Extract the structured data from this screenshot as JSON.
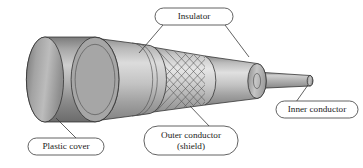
{
  "figure": {
    "background_color": "#ffffff",
    "line_color": "#2e2e2e"
  },
  "callouts": [
    {
      "id": "insulator",
      "label": "Insulator",
      "lines": [
        "Insulator"
      ],
      "box": {
        "x": 155,
        "y": 8,
        "w": 78,
        "h": 17,
        "rx": 8.5
      },
      "text_x": 194,
      "text_y": 17,
      "leaders": [
        {
          "x1": 163,
          "y1": 25,
          "x2": 139,
          "y2": 53
        },
        {
          "x1": 225,
          "y1": 25,
          "x2": 249,
          "y2": 57
        }
      ]
    },
    {
      "id": "plastic-cover",
      "label": "Plastic cover",
      "lines": [
        "Plastic cover"
      ],
      "box": {
        "x": 28,
        "y": 138,
        "w": 76,
        "h": 17,
        "rx": 8.5
      },
      "text_x": 66,
      "text_y": 147,
      "leaders": [
        {
          "x1": 76,
          "y1": 138,
          "x2": 56,
          "y2": 118
        }
      ]
    },
    {
      "id": "outer-conductor",
      "label": "Outer conductor (shield)",
      "lines": [
        "Outer conductor",
        "(shield)"
      ],
      "box": {
        "x": 144,
        "y": 126,
        "w": 94,
        "h": 29,
        "rx": 14
      },
      "text_x": 191,
      "text_y": 135,
      "leaders": [
        {
          "x1": 210,
          "y1": 126,
          "x2": 190,
          "y2": 106
        }
      ]
    },
    {
      "id": "inner-conductor",
      "label": "Inner conductor",
      "lines": [
        "Inner conductor"
      ],
      "box": {
        "x": 276,
        "y": 101,
        "w": 82,
        "h": 17,
        "rx": 8.5
      },
      "text_x": 317,
      "text_y": 110,
      "leaders": [
        {
          "x1": 296,
          "y1": 101,
          "x2": 308,
          "y2": 85
        }
      ]
    }
  ],
  "cable_layers": [
    {
      "name": "plastic-cover",
      "role": "outermost jacket",
      "shade_dark": "#6d6d6d",
      "shade_light": "#c9c9c9"
    },
    {
      "name": "insulator-outer",
      "role": "dielectric under jacket",
      "shade_dark": "#8a8a8a",
      "shade_light": "#d6d6d6"
    },
    {
      "name": "outer-conductor-braid",
      "role": "braided shield mesh",
      "shade_dark": "#9a9a9a",
      "shade_light": "#e2e2e2"
    },
    {
      "name": "insulator-inner",
      "role": "dielectric around core",
      "shade_dark": "#8f8f8f",
      "shade_light": "#dcdcdc"
    },
    {
      "name": "inner-conductor",
      "role": "center wire",
      "shade_dark": "#8a8a8a",
      "shade_light": "#d2d2d2"
    }
  ]
}
